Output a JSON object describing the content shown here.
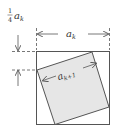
{
  "diagram": {
    "outer_square": {
      "label": "a",
      "label_sub": "k",
      "stroke": "#555555",
      "fill": "#ffffff"
    },
    "inner_square": {
      "label": "a",
      "label_sub": "k+1",
      "stroke": "#555555",
      "fill": "#e6e6e6"
    },
    "offset_label": {
      "coefficient_num": "1",
      "coefficient_den": "4",
      "var": "a",
      "var_sub": "k"
    },
    "colors": {
      "line": "#555555",
      "shade": "#e6e6e6",
      "text": "#333333"
    }
  }
}
